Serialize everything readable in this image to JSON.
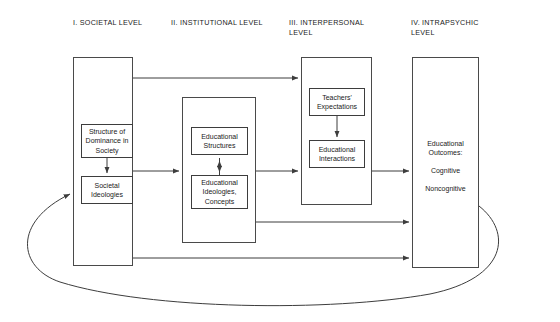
{
  "diagram": {
    "background": "#ffffff",
    "line_color": "#4a4a4a",
    "text_color": "#1a1a1a",
    "columns": [
      {
        "id": "societal",
        "header": "I. SOCIETAL LEVEL",
        "boxes": [
          {
            "id": "structure-of-dominance",
            "label": "Structure of\nDominance in\nSociety"
          },
          {
            "id": "societal-ideologies",
            "label": "Societal\nIdeologies"
          }
        ]
      },
      {
        "id": "institutional",
        "header": "II. INSTITUTIONAL LEVEL",
        "boxes": [
          {
            "id": "educational-structures",
            "label": "Educational\nStructures"
          },
          {
            "id": "educational-ideologies-concepts",
            "label": "Educational\nIdeologies,\nConcepts"
          }
        ]
      },
      {
        "id": "interpersonal",
        "header": "III. INTERPERSONAL\n     LEVEL",
        "boxes": [
          {
            "id": "teachers-expectations",
            "label": "Teachers'\nExpectations"
          },
          {
            "id": "educational-interactions",
            "label": "Educational\nInteractions"
          }
        ]
      },
      {
        "id": "intrapsychic",
        "header": "IV. INTRAPSYCHIC\n     LEVEL",
        "texts": [
          {
            "id": "educational-outcomes",
            "label": "Educational\nOutcomes:"
          },
          {
            "id": "cognitive",
            "label": "Cognitive"
          },
          {
            "id": "noncognitive",
            "label": "Noncognitive"
          }
        ]
      }
    ],
    "connectors": [
      {
        "id": "structure-to-ideologies",
        "type": "arrow-down"
      },
      {
        "id": "edstructures-to-edideologies",
        "type": "arrow-double-vertical"
      },
      {
        "id": "expectations-to-interactions",
        "type": "arrow-down"
      },
      {
        "id": "societal-to-interpersonal-top",
        "type": "arrow-right"
      },
      {
        "id": "societal-to-institutional",
        "type": "arrow-right"
      },
      {
        "id": "institutional-to-interpersonal",
        "type": "arrow-right"
      },
      {
        "id": "interpersonal-to-intrapsychic",
        "type": "arrow-right"
      },
      {
        "id": "institutional-to-intrapsychic",
        "type": "arrow-right"
      },
      {
        "id": "societal-to-intrapsychic",
        "type": "arrow-right"
      },
      {
        "id": "feedback-loop-outcomes-to-societal-ideologies",
        "type": "curved-arrow"
      }
    ]
  }
}
